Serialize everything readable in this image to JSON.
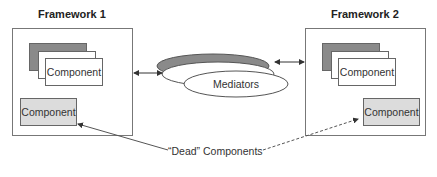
{
  "diagram": {
    "framework1": {
      "title": "Framework 1",
      "stack_component_label": "Component",
      "dead_component_label": "Component"
    },
    "framework2": {
      "title": "Framework 2",
      "stack_component_label": "Component",
      "dead_component_label": "Component"
    },
    "mediators": {
      "label": "Mediators"
    },
    "dead_components_label": "“Dead” Components",
    "colors": {
      "stack_dark": "#8a8a8a",
      "dead_fill": "#dcdcdc",
      "border": "#666666",
      "ellipse_dark": "#8a8a8a"
    }
  }
}
